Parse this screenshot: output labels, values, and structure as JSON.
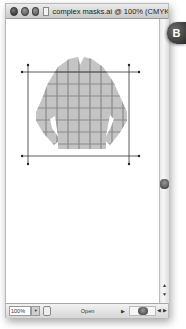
{
  "window": {
    "title": "complex masks.ai @ 100% (CMYK/Prev...",
    "traffic_lights": [
      "close",
      "minimize",
      "zoom"
    ]
  },
  "callout": {
    "label": "B",
    "color": "#3a3a3a"
  },
  "artwork": {
    "description": "gridded long-sleeve shirt shape with crop marks",
    "fill_color": "#c4c4c4",
    "grid_color": "#8a8a8a",
    "crop_mark_color": "#333333"
  },
  "statusbar": {
    "zoom_value": "100%",
    "zoom_dropdown_icon": "chevron-down-icon",
    "status_label": "Open",
    "status_arrow_icon": "triangle-right-icon",
    "nav_prev_icon": "triangle-left-icon",
    "nav_next_icon": "triangle-right-icon"
  },
  "scrollbar": {
    "up_icon": "triangle-up-icon",
    "down_icon": "triangle-down-icon"
  }
}
